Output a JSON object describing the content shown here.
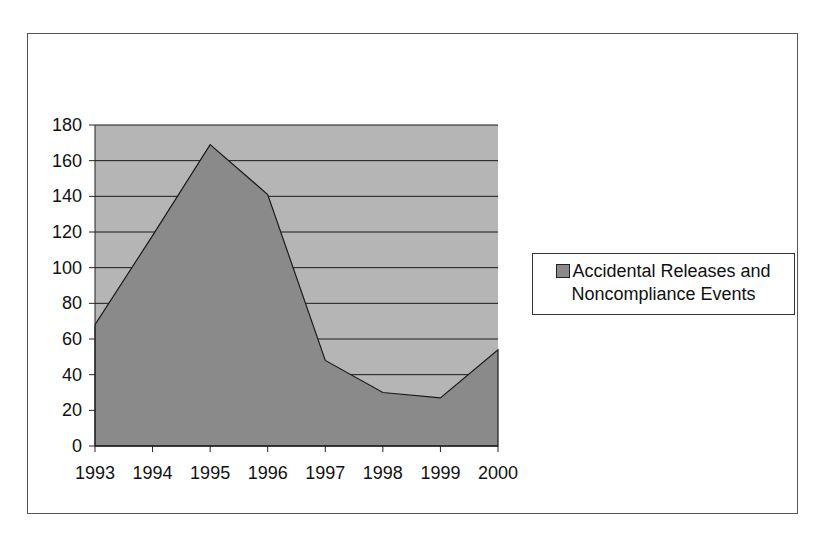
{
  "chart_data": {
    "type": "area",
    "title": "",
    "xlabel": "",
    "ylabel": "",
    "categories": [
      "1993",
      "1994",
      "1995",
      "1996",
      "1997",
      "1998",
      "1999",
      "2000"
    ],
    "series": [
      {
        "name": "Accidental Releases and Noncompliance Events",
        "values": [
          68,
          118,
          169,
          141,
          48,
          30,
          27,
          54
        ]
      }
    ],
    "ylim": [
      0,
      180
    ],
    "yticks": [
      0,
      20,
      40,
      60,
      80,
      100,
      120,
      140,
      160,
      180
    ],
    "grid": true,
    "legend_position": "right"
  },
  "colors": {
    "plot_background": "#b5b5b5",
    "area_fill": "#8a8a8a",
    "gridline": "#1a1a1a",
    "frame_border": "#555555"
  },
  "legend": {
    "line1": "Accidental Releases and",
    "line2": "Noncompliance Events"
  }
}
